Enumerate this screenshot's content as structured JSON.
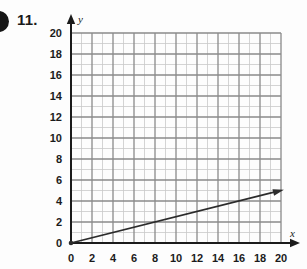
{
  "page": {
    "problem_number": "11.",
    "edge_marker": "page-edge-dot"
  },
  "chart_data": {
    "type": "line",
    "title": "",
    "xlabel": "x",
    "ylabel": "y",
    "xlim": [
      0,
      20
    ],
    "ylim": [
      0,
      20
    ],
    "grid": true,
    "grid_minor_step": 1,
    "grid_major_step": 2,
    "legend": "none",
    "x_ticks": [
      0,
      2,
      4,
      6,
      8,
      10,
      12,
      14,
      16,
      18,
      20
    ],
    "y_ticks": [
      0,
      2,
      4,
      6,
      8,
      10,
      12,
      14,
      16,
      18,
      20
    ],
    "x_tick_labels": [
      "0",
      "2",
      "4",
      "6",
      "8",
      "10",
      "12",
      "14",
      "16",
      "18",
      "20"
    ],
    "y_tick_labels": [
      "0",
      "2",
      "4",
      "6",
      "8",
      "10",
      "12",
      "14",
      "16",
      "18",
      "20"
    ],
    "series": [
      {
        "name": "ray",
        "slope": 0.25,
        "intercept": 0,
        "equation": "y = 0.25x",
        "start_point": [
          0,
          0
        ],
        "end_point": [
          20,
          5
        ],
        "arrow_at_end": true,
        "dot_at_start": true,
        "x": [
          0,
          20
        ],
        "values": [
          0,
          5
        ],
        "color": "#2b2b2b"
      }
    ],
    "colors": {
      "axis": "#1b1b1b",
      "grid_minor": "#c9c9c9",
      "grid_major": "#8a8a8a",
      "line": "#2b2b2b",
      "background": "#fdfdfd"
    }
  }
}
